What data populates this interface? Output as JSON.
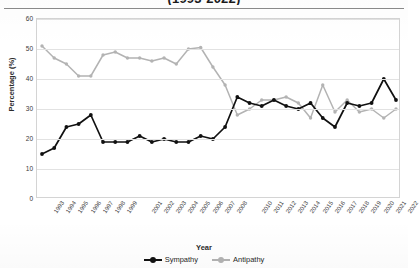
{
  "chart_data": {
    "type": "line",
    "title": "(1993-2022)",
    "xlabel": "Year",
    "ylabel": "Percentage (%)",
    "ylim": [
      0,
      60
    ],
    "ytick_values": [
      0,
      10,
      20,
      30,
      40,
      50,
      60
    ],
    "grid": true,
    "legend_position": "bottom",
    "x": [
      1993,
      1994,
      1995,
      1996,
      1997,
      1998,
      1999,
      2000,
      2001,
      2002,
      2003,
      2004,
      2005,
      2006,
      2007,
      2008,
      2009,
      2010,
      2011,
      2012,
      2013,
      2014,
      2015,
      2016,
      2017,
      2018,
      2019,
      2020,
      2021,
      2022
    ],
    "xtick_labels": [
      "1993",
      "1994",
      "1995",
      "1996",
      "1997",
      "1998",
      "1999",
      "",
      "2001",
      "2002",
      "2003",
      "2004",
      "2005",
      "2006",
      "2007",
      "2008",
      "",
      "2010",
      "2011",
      "2012",
      "2013",
      "2014",
      "2015",
      "2016",
      "2017",
      "2018",
      "2019",
      "2020",
      "2021",
      "2022"
    ],
    "series": [
      {
        "name": "Sympathy",
        "color": "#111111",
        "values": [
          15,
          17,
          24,
          25,
          28,
          19,
          19,
          19,
          21,
          19,
          20,
          19,
          19,
          21,
          20,
          24,
          34,
          32,
          31,
          33,
          31,
          30,
          32,
          27,
          24,
          32,
          31,
          32,
          40,
          33
        ]
      },
      {
        "name": "Antipathy",
        "color": "#b3b3b3",
        "values": [
          51,
          47,
          45,
          41,
          41,
          48,
          49,
          47,
          47,
          46,
          47,
          45,
          50,
          50.5,
          44,
          38,
          28,
          30,
          33,
          33,
          34,
          32,
          27,
          38,
          29,
          33,
          29,
          30,
          27,
          30
        ]
      }
    ],
    "legend": [
      {
        "label": "Sympathy",
        "color": "#111111"
      },
      {
        "label": "Antipathy",
        "color": "#b3b3b3"
      }
    ]
  }
}
